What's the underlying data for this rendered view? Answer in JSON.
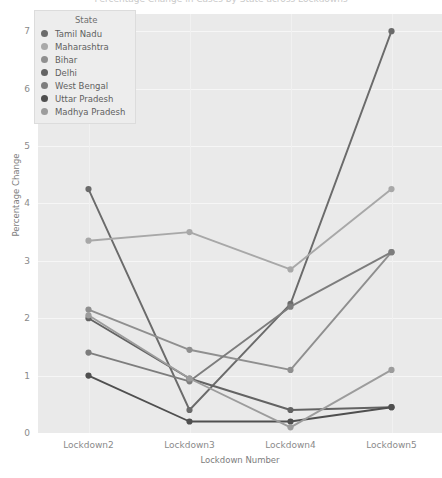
{
  "chart_data": {
    "type": "line",
    "title": "Percentage Change in Cases by State across Lockdowns",
    "xlabel": "Lockdown Number",
    "ylabel": "Percentage Change",
    "categories": [
      "Lockdown2",
      "Lockdown3",
      "Lockdown4",
      "Lockdown5"
    ],
    "ylim": [
      0,
      7.3
    ],
    "yticks": [
      0,
      1,
      2,
      3,
      4,
      5,
      6,
      7
    ],
    "grid": true,
    "legend_position": "upper-left",
    "legend_title": "State",
    "series": [
      {
        "name": "Tamil Nadu",
        "color": "#6b6b6b",
        "values": [
          4.25,
          0.4,
          2.25,
          7.0
        ]
      },
      {
        "name": "Maharashtra",
        "color": "#a8a8a8",
        "values": [
          3.35,
          3.5,
          2.85,
          4.25
        ]
      },
      {
        "name": "Bihar",
        "color": "#8f8f8f",
        "values": [
          2.15,
          1.45,
          1.1,
          3.15
        ]
      },
      {
        "name": "Delhi",
        "color": "#636363",
        "values": [
          2.0,
          0.95,
          0.4,
          0.45
        ]
      },
      {
        "name": "West Bengal",
        "color": "#7d7d7d",
        "values": [
          1.4,
          0.9,
          2.2,
          3.15
        ]
      },
      {
        "name": "Uttar Pradesh",
        "color": "#4f4f4f",
        "values": [
          1.0,
          0.2,
          0.2,
          0.45
        ]
      },
      {
        "name": "Madhya Pradesh",
        "color": "#9c9c9c",
        "values": [
          2.05,
          0.95,
          0.1,
          1.1
        ]
      }
    ]
  }
}
